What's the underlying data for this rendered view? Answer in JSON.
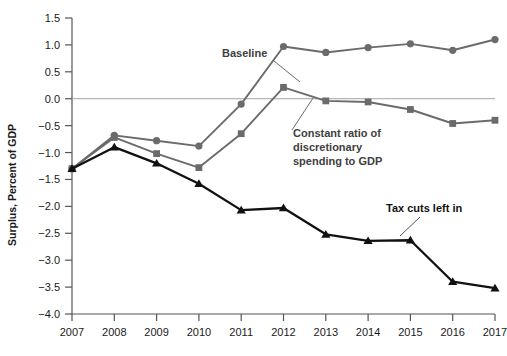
{
  "chart_data": {
    "type": "line",
    "title": "",
    "xlabel": "",
    "ylabel": "Surplus, Percent of GDP",
    "x": [
      2007,
      2008,
      2009,
      2010,
      2011,
      2012,
      2013,
      2014,
      2015,
      2016,
      2017
    ],
    "xtick_labels": [
      "2007",
      "2008",
      "2009",
      "2010",
      "2011",
      "2012",
      "2013",
      "2014",
      "2015",
      "2016",
      "2017"
    ],
    "ytick_labels": [
      "1.5",
      "1.0",
      "0.5",
      "0.0",
      "-0.5",
      "-1.0",
      "-1.5",
      "-2.0",
      "-2.5",
      "-3.0",
      "-3.5",
      "-4.0"
    ],
    "ytick_values": [
      1.5,
      1.0,
      0.5,
      0.0,
      -0.5,
      -1.0,
      -1.5,
      -2.0,
      -2.5,
      -3.0,
      -3.5,
      -4.0
    ],
    "ylim": [
      -4.0,
      1.5
    ],
    "xlim": [
      2007,
      2017
    ],
    "grid": false,
    "zero_line": true,
    "legend_position": "inline-annotations",
    "series": [
      {
        "name": "Baseline",
        "marker": "circle",
        "color": "#6b6b6b",
        "values": [
          -1.3,
          -0.68,
          -0.78,
          -0.88,
          -0.1,
          0.97,
          0.86,
          0.95,
          1.02,
          0.9,
          1.1
        ]
      },
      {
        "name": "Constant ratio of discretionary spending to GDP",
        "marker": "square",
        "color": "#6b6b6b",
        "values": [
          -1.3,
          -0.72,
          -1.02,
          -1.28,
          -0.65,
          0.21,
          -0.04,
          -0.06,
          -0.2,
          -0.46,
          -0.4
        ]
      },
      {
        "name": "Tax cuts left in",
        "marker": "triangle",
        "color": "#111111",
        "values": [
          -1.3,
          -0.9,
          -1.2,
          -1.58,
          -2.07,
          -2.03,
          -2.52,
          -2.64,
          -2.63,
          -3.4,
          -3.52
        ]
      }
    ],
    "annotations": [
      {
        "text": "Baseline",
        "target_series": "Baseline",
        "color": "#404040"
      },
      {
        "text": "Constant ratio of",
        "target_series": "Constant ratio of discretionary spending to GDP",
        "color": "#404040"
      },
      {
        "text": "discretionary",
        "target_series": "Constant ratio of discretionary spending to GDP",
        "color": "#404040"
      },
      {
        "text": "spending to GDP",
        "target_series": "Constant ratio of discretionary spending to GDP",
        "color": "#404040"
      },
      {
        "text": "Tax cuts left in",
        "target_series": "Tax cuts left in",
        "color": "#111111"
      }
    ]
  }
}
